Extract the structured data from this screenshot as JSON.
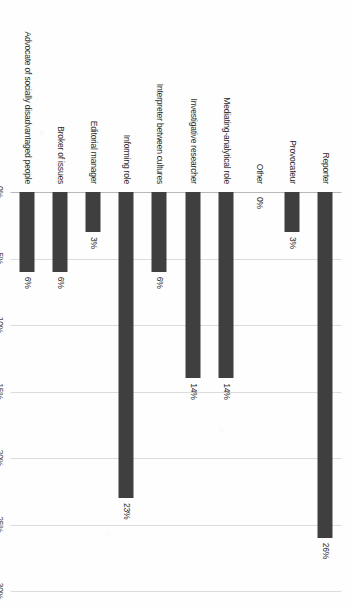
{
  "chart_data": {
    "type": "bar",
    "title": "",
    "subtitle": "",
    "xlabel": "",
    "ylabel": "",
    "orientation": "vertical-rotated",
    "grid": true,
    "legend": false,
    "legend_position": "none",
    "ylim": [
      0,
      30
    ],
    "axis_ticks": [
      "0%",
      "5%",
      "10%",
      "15%",
      "20%",
      "25%",
      "30%"
    ],
    "axis_tick_values": [
      0,
      5,
      10,
      15,
      20,
      25,
      30
    ],
    "bar_color": "#3f3f3f",
    "gridline_color": "#dcdcdc",
    "categories": [
      "Reporter",
      "Provocateur",
      "Other",
      "Mediating-analytical role",
      "Investigative researcher",
      "Interpreter between cultures",
      "Informing role",
      "Editorial manager",
      "Broker of issues",
      "Advocate of socially disadvantaged people"
    ],
    "values": [
      26,
      3,
      0,
      14,
      14,
      6,
      23,
      3,
      6,
      6
    ],
    "data_labels": [
      "26%",
      "3%",
      "0%",
      "14%",
      "14%",
      "6%",
      "23%",
      "3%",
      "6%",
      "6%"
    ]
  }
}
